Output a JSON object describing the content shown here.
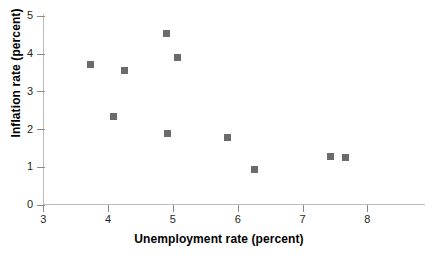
{
  "chart_data": {
    "type": "scatter",
    "title": "",
    "xlabel": "Unemployment rate (percent)",
    "ylabel": "Inflation rate (percent)",
    "xlim": [
      3,
      8.9
    ],
    "ylim": [
      0,
      5
    ],
    "xticks": [
      3,
      4,
      5,
      6,
      7,
      8
    ],
    "yticks": [
      0,
      1,
      2,
      3,
      4,
      5
    ],
    "xtick_labels": [
      "3",
      "4",
      "5",
      "6",
      "7",
      "8"
    ],
    "ytick_labels": [
      "0",
      "1",
      "2",
      "3",
      "4",
      "5"
    ],
    "grid": false,
    "legend": null,
    "marker": {
      "shape": "square",
      "color": "#6b6b6b",
      "size_px": 7
    },
    "axis_color": "#bdbdbd",
    "text_color": "#231f20",
    "background": "#ffffff",
    "points": [
      {
        "x": 3.73,
        "y": 3.71
      },
      {
        "x": 4.08,
        "y": 2.33
      },
      {
        "x": 4.26,
        "y": 3.55
      },
      {
        "x": 4.9,
        "y": 4.52
      },
      {
        "x": 4.92,
        "y": 1.89
      },
      {
        "x": 5.07,
        "y": 3.9
      },
      {
        "x": 5.85,
        "y": 1.78
      },
      {
        "x": 6.26,
        "y": 0.93
      },
      {
        "x": 7.43,
        "y": 1.27
      },
      {
        "x": 7.66,
        "y": 1.24
      }
    ]
  }
}
